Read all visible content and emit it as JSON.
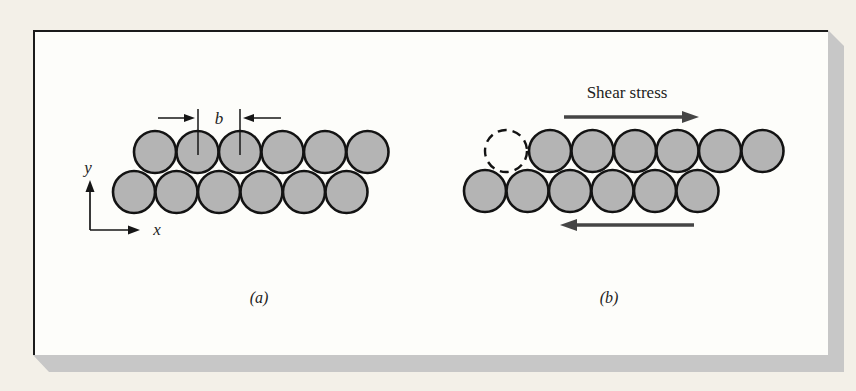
{
  "figure": {
    "panel_a": {
      "caption": "(a)",
      "burgers_vector_label": "b",
      "axis_x_label": "x",
      "axis_y_label": "y",
      "atoms_top_row": 6,
      "atoms_bottom_row": 6
    },
    "panel_b": {
      "caption": "(b)",
      "shear_stress_label": "Shear stress",
      "atoms_top_row": 6,
      "atoms_bottom_row": 6,
      "dashed_atom_original_position": true,
      "top_arrow_direction": "right",
      "bottom_arrow_direction": "left"
    },
    "colors": {
      "page_background": "#f3f0e8",
      "panel_background": "#fdfdfa",
      "slab_shadow": "#c7c7c7",
      "atom_fill": "#b4b4b4",
      "arrow": "#454545"
    }
  }
}
